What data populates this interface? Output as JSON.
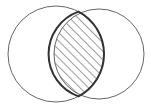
{
  "diagram": {
    "type": "venn",
    "sets": [
      {
        "name": "left-set",
        "cx": 56,
        "cy": 54,
        "r": 48
      },
      {
        "name": "right-set",
        "cx": 99,
        "cy": 54,
        "r": 45
      }
    ],
    "highlighted_region": "intersection",
    "colors": {
      "stroke": "#555555",
      "hatch": "#666666",
      "background": "#ffffff"
    }
  }
}
